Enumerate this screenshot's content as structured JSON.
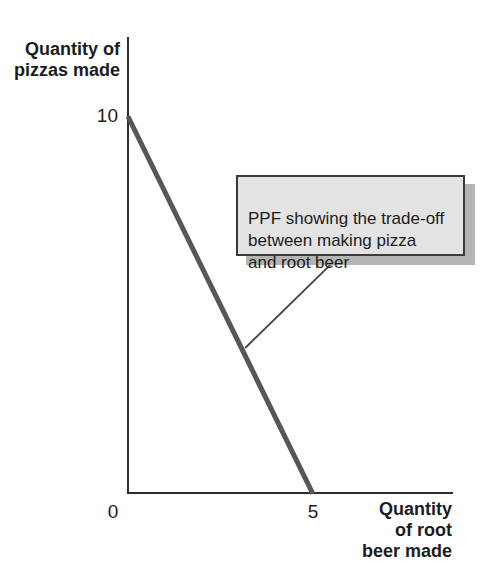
{
  "figure": {
    "y_axis_label": "Quantity of\npizzas made",
    "x_axis_label": "Quantity\nof root\nbeer made",
    "ticks": {
      "y10": "10",
      "x0": "0",
      "x5": "5"
    },
    "callout": {
      "text": "PPF showing the trade-off\nbetween making pizza\nand root beer"
    }
  },
  "colors": {
    "ppf_line": "#57575a",
    "axis": "#2e2e2e",
    "text": "#1c1c1c",
    "callout_bg": "#e3e3e3",
    "callout_border": "#3a3a3a",
    "callout_shadow": "#b5b5b5",
    "leader": "#4a4a4a",
    "background": "#ffffff"
  },
  "chart_data": {
    "type": "line",
    "title": "",
    "xlabel": "Quantity of root beer made",
    "ylabel": "Quantity of pizzas made",
    "x": [
      0,
      5
    ],
    "series": [
      {
        "name": "PPF",
        "values": [
          10,
          0
        ]
      }
    ],
    "x_ticks": [
      0,
      5
    ],
    "y_ticks": [
      10
    ],
    "xlim": [
      0,
      7.5
    ],
    "ylim": [
      0,
      12
    ],
    "grid": false,
    "legend": false,
    "line_color": "#57575a",
    "line_width_px": 5,
    "annotations": [
      {
        "text": "PPF showing the trade-off between making pizza and root beer",
        "style": "boxed-callout-with-leader-line",
        "points_to": {
          "x": 3.2,
          "y": 3.9
        }
      }
    ]
  }
}
